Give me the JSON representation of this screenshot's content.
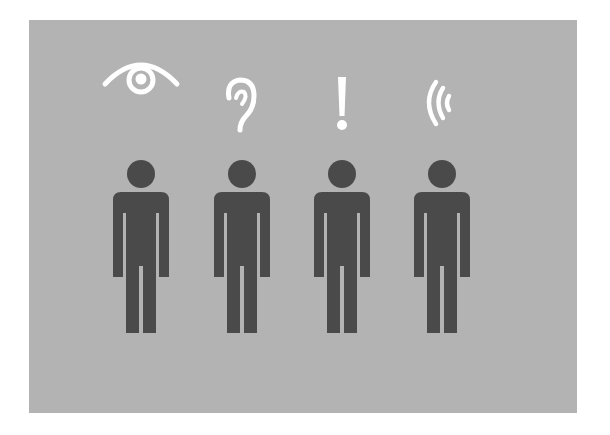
{
  "illustration": {
    "background_color": "#b3b3b3",
    "figure_color": "#4a4a4a",
    "icon_color": "#ffffff",
    "figures": [
      {
        "name": "person-seeing",
        "icon": "eye-icon"
      },
      {
        "name": "person-hearing",
        "icon": "ear-icon"
      },
      {
        "name": "person-alert",
        "icon": "exclamation-icon"
      },
      {
        "name": "person-sound",
        "icon": "sound-waves-icon"
      }
    ]
  }
}
